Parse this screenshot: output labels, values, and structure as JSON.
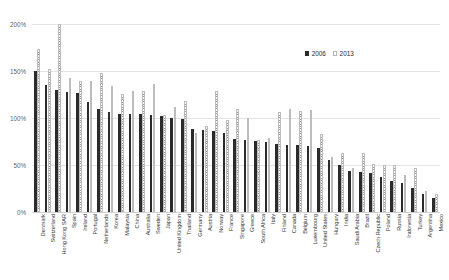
{
  "chart_data": {
    "type": "bar",
    "title": "",
    "subtitle": "",
    "xlabel": "",
    "ylabel": "",
    "ylim": [
      0,
      200
    ],
    "ytick_labels": [
      "0%",
      "50%",
      "100%",
      "150%",
      "200%"
    ],
    "ytick_values": [
      0,
      50,
      100,
      150,
      200
    ],
    "grid": true,
    "legend_position": "top-right",
    "categories": [
      "Denmark",
      "Switzerland",
      "Hong Kong SAR",
      "Spain",
      "Ireland",
      "Portugal",
      "Netherlands",
      "Korea",
      "Malaysia",
      "China",
      "Australia",
      "Sweden",
      "Japan",
      "United Kingdom",
      "Thailand",
      "Germany",
      "Austria",
      "Norway",
      "France",
      "Singapore",
      "Greece",
      "South Africa",
      "Italy",
      "Finland",
      "Canada",
      "Belgium",
      "Luxembourg",
      "United States",
      "Hungary",
      "India",
      "Saudi Arabia",
      "Brazil",
      "Czech Republic",
      "Poland",
      "Russia",
      "Indonesia",
      "Turkey",
      "Argentina",
      "Mexico"
    ],
    "series": [
      {
        "name": "2006",
        "color": "#2b2b2b",
        "values": [
          150,
          135,
          130,
          128,
          127,
          117,
          110,
          106,
          104,
          104,
          104,
          103,
          102,
          100,
          99,
          88,
          87,
          86,
          84,
          78,
          77,
          76,
          75,
          72,
          71,
          71,
          70,
          68,
          55,
          50,
          44,
          43,
          41,
          37,
          33,
          31,
          26,
          19,
          15
        ]
      },
      {
        "name": "2013",
        "color": "#9a9a9a",
        "values": [
          173,
          152,
          200,
          143,
          139,
          139,
          148,
          134,
          126,
          129,
          129,
          136,
          103,
          112,
          118,
          84,
          92,
          129,
          98,
          110,
          100,
          77,
          79,
          106,
          110,
          107,
          109,
          83,
          59,
          63,
          47,
          63,
          51,
          50,
          50,
          39,
          47,
          22,
          19
        ]
      }
    ]
  },
  "legend": {
    "items": [
      {
        "label": "2006"
      },
      {
        "label": "2013"
      }
    ]
  }
}
